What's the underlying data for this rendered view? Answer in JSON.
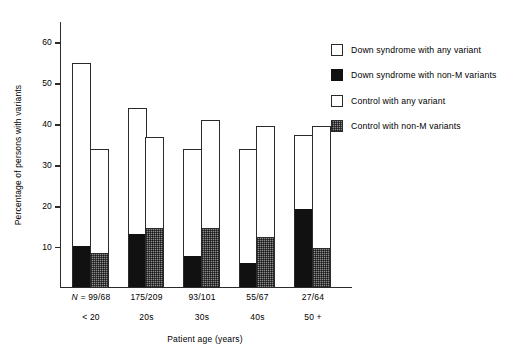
{
  "chart_data": {
    "type": "bar",
    "title": "",
    "xlabel": "Patient age (years)",
    "ylabel": "Percentage of persons with variants",
    "categories": [
      "< 20",
      "20s",
      "30s",
      "40s",
      "50 +"
    ],
    "n_prefix": "N = ",
    "n_labels": [
      "99/68",
      "175/209",
      "93/101",
      "55/67",
      "27/64"
    ],
    "ylim": [
      0,
      65
    ],
    "yticks": [
      10,
      20,
      30,
      40,
      50,
      60
    ],
    "ytick_labels": [
      "10",
      "20",
      "30",
      "40",
      "50",
      "60"
    ],
    "grid": false,
    "legend_position": "right",
    "series": [
      {
        "name": "Down syndrome with any variant",
        "swatch": "white-outline",
        "values": [
          55.0,
          44.0,
          34.0,
          34.0,
          37.3
        ]
      },
      {
        "name": "Down syndrome with non-M variants",
        "swatch": "black-fill",
        "values": [
          10.1,
          13.0,
          7.7,
          5.8,
          19.0
        ]
      },
      {
        "name": "Control with any variant",
        "swatch": "white-outline",
        "values": [
          34.0,
          37.0,
          41.0,
          39.5,
          39.5
        ]
      },
      {
        "name": "Control with non-M variants",
        "swatch": "gray-fill",
        "values": [
          8.4,
          14.3,
          14.4,
          12.2,
          9.5
        ]
      }
    ]
  },
  "legend": {
    "items": [
      {
        "label": "Down syndrome with any variant",
        "swatch": "white-outline"
      },
      {
        "label": "Down syndrome with non-M variants",
        "swatch": "black-fill"
      },
      {
        "label": "Control with any variant",
        "swatch": "white-outline"
      },
      {
        "label": "Control with non-M variants",
        "swatch": "gray-fill"
      }
    ]
  },
  "colors": {
    "axis": "#2b2b2b",
    "black_fill": "#111111",
    "gray_fill": "#8c8c8c",
    "background": "#ffffff"
  }
}
